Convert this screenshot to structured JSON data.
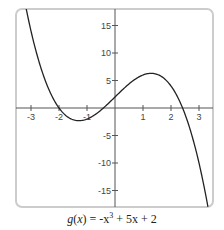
{
  "chart_data": {
    "type": "line",
    "title": "",
    "caption": {
      "func": "g",
      "var": "x",
      "expr_pre": "-x",
      "expr_exp": "3",
      "expr_post": " + 5x + 2"
    },
    "function": {
      "name": "g(x) = -x^3 + 5x + 2",
      "coefficients": {
        "a3": -1,
        "a2": 0,
        "a1": 5,
        "a0": 2
      }
    },
    "xlabel": "",
    "ylabel": "",
    "xlim": [
      -3.5,
      3.5
    ],
    "ylim": [
      -18,
      18
    ],
    "x_ticks": [
      -3,
      -2,
      -1,
      1,
      2,
      3
    ],
    "y_ticks": [
      15,
      10,
      5,
      -5,
      -10,
      -15
    ],
    "grid": false,
    "series": [
      {
        "name": "g(x)",
        "x": [
          -3.3,
          -3,
          -2.5,
          -2,
          -1.5,
          -1,
          -0.5,
          0,
          0.5,
          1,
          1.29,
          1.5,
          2,
          2.5,
          3,
          3.3
        ],
        "values": [
          21.44,
          14,
          5.13,
          0,
          -2.13,
          -2,
          -0.38,
          2,
          4.38,
          6,
          6.3,
          6.13,
          4,
          -1.13,
          -10,
          -17.44
        ]
      }
    ],
    "colors": {
      "curve": "#222222",
      "axis": "#555555",
      "frame": "#cccccc"
    }
  }
}
